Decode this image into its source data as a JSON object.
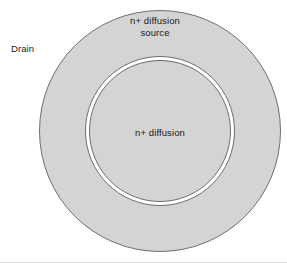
{
  "figure": {
    "type": "concentric-circle-diagram",
    "width": 287,
    "height": 266,
    "background_color": "#ffffff",
    "fill_color": "#d4d4d4",
    "stroke_color": "#6e6e6e",
    "gap_color": "#ffffff",
    "text_color": "#1a1a1a"
  },
  "shapes": {
    "outer_circle": {
      "name": "n+ diffusion source region",
      "cx": 160,
      "cy": 131,
      "r": 121,
      "fill": "#d4d4d4",
      "stroke": "#6e6e6e",
      "stroke_width": 1
    },
    "gap_ring": {
      "name": "isolation gap ring",
      "cx": 160,
      "cy": 131,
      "r": 75,
      "fill": "#ffffff",
      "stroke": "#6e6e6e",
      "stroke_width": 1
    },
    "inner_circle": {
      "name": "n+ diffusion region",
      "cx": 160,
      "cy": 131,
      "r": 71,
      "fill": "#d4d4d4",
      "stroke": "#6e6e6e",
      "stroke_width": 1
    }
  },
  "labels": {
    "drain": "Drain",
    "source_line1": "n+ diffusion",
    "source_line2": "source",
    "source": "n+ diffusion\nsource",
    "inner": "n+ diffusion"
  }
}
